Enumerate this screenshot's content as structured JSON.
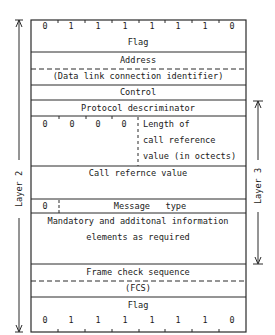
{
  "frame": {
    "top_flag_bits": [
      "0",
      "1",
      "1",
      "1",
      "1",
      "1",
      "1",
      "0"
    ],
    "rows": {
      "flag_top": "Flag",
      "address": "Address",
      "dlci": "(Data link connection identifier)",
      "control": "Control",
      "protocol": "Protocol descriminator",
      "length_bits": [
        "0",
        "0",
        "0",
        "0"
      ],
      "length_line1": "Length of",
      "length_line2": "call reference",
      "length_line3": "value (in octects)",
      "call_ref": "Call refernce value",
      "msg_bit": "0",
      "msg_type": "Message   type",
      "info_line1": "Mandatory and additonal information",
      "info_line2": "elements as required",
      "fcs_line1": "Frame check sequence",
      "fcs_line2": "(FCS)",
      "flag_bottom": "Flag"
    },
    "bottom_flag_bits": [
      "0",
      "1",
      "1",
      "1",
      "1",
      "1",
      "1",
      "0"
    ]
  },
  "labels": {
    "layer2": "Layer 2",
    "layer3": "Layer 3"
  },
  "colors": {
    "line": "#2a2a2a",
    "background": "#ffffff"
  }
}
